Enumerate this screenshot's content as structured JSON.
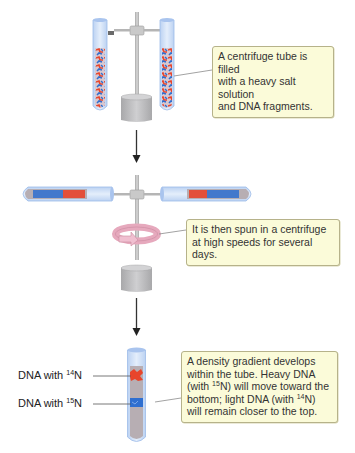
{
  "diagram": {
    "type": "process-flow",
    "title": "",
    "steps": [
      {
        "id": "fill",
        "callout": "A centrifuge tube is filled with a heavy salt solution and DNA fragments.",
        "callout_lines": [
          "A centrifuge tube is filled",
          "with a heavy salt solution",
          "and DNA fragments."
        ]
      },
      {
        "id": "spin",
        "callout": "It is then spun in a centrifuge at high speeds for several days.",
        "callout_lines": [
          "It is then spun in a centrifuge",
          "at high speeds for several days."
        ]
      },
      {
        "id": "gradient",
        "callout": "A density gradient develops within the tube. Heavy DNA (with 15N) will move toward the bottom; light DNA (with 14N) will remain closer to the top.",
        "callout_lines": {
          "l1": "A density gradient develops",
          "l2": "within the tube. Heavy DNA",
          "l3a": "(with ",
          "l3sup": "15",
          "l3b": "N) will move toward the",
          "l4a": "bottom; light DNA (with ",
          "l4sup": "14",
          "l4b": "N)",
          "l5": "will remain closer to the top."
        }
      }
    ],
    "labels": {
      "dna14": {
        "prefix": "DNA with ",
        "isotope": "14",
        "element": "N"
      },
      "dna15": {
        "prefix": "DNA with ",
        "isotope": "15",
        "element": "N"
      }
    },
    "icons": [
      "centrifuge-stand-icon",
      "test-tube-icon",
      "rotation-arrow-icon",
      "down-arrow-icon"
    ],
    "colors": {
      "callout_bg": "#fbfbd9",
      "callout_border": "#b6b28a",
      "tube_glass": "#cfe0f7",
      "tube_outline": "#9dbbe8",
      "dna_light_14N": "#e8452c",
      "dna_heavy_15N": "#2f6fd0",
      "solution": "#b7aeb3",
      "stand_gray": "#bdbdbd",
      "rotation_pink": "#e6a9bd",
      "arrow": "#333333"
    }
  }
}
